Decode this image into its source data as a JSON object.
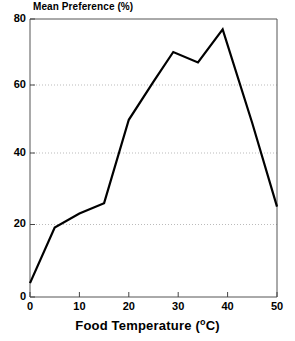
{
  "chart_data": {
    "type": "line",
    "title": "Mean Preference (%)",
    "xlabel": "Food Temperature (°C)",
    "ylabel": "Mean Preference (%)",
    "xlim": [
      0,
      50
    ],
    "ylim": [
      0,
      80
    ],
    "xticks": [
      0,
      10,
      20,
      30,
      40,
      50
    ],
    "yticks": [
      0,
      20,
      40,
      60,
      80
    ],
    "xtick_labels": [
      "0",
      "10",
      "20",
      "30",
      "40",
      "50"
    ],
    "ytick_labels": [
      "0",
      "20",
      "40",
      "60",
      "80"
    ],
    "grid": "horizontal-dotted",
    "legend": "none",
    "line_color": "#000000",
    "line_width": 2,
    "x": [
      0,
      5,
      10,
      15,
      20,
      25,
      29,
      34,
      39,
      45,
      50
    ],
    "values": [
      4,
      20,
      24,
      27,
      51,
      62,
      70.5,
      67.5,
      77,
      50,
      26
    ],
    "series": [
      {
        "name": "Mean Preference",
        "x": [
          0,
          5,
          10,
          15,
          20,
          25,
          29,
          34,
          39,
          45,
          50
        ],
        "values": [
          4,
          20,
          24,
          27,
          51,
          62,
          70.5,
          67.5,
          77,
          50,
          26
        ]
      }
    ]
  },
  "axis_title": {
    "x_main": "Food Temperature (",
    "x_degree": "o",
    "x_unit": "C)"
  }
}
